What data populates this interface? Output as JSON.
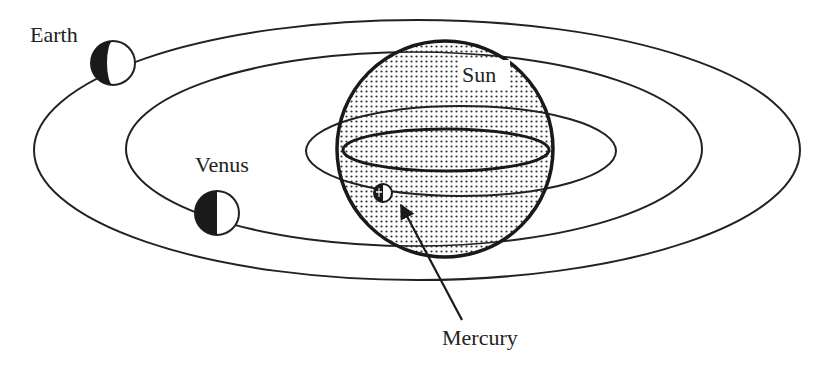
{
  "diagram": {
    "type": "solar-system-transit-schematic",
    "colors": {
      "line": "#222222",
      "background": "#ffffff",
      "sun_fill_dots": "#333333",
      "planet_dark": "#1a1a1a",
      "planet_light": "#ffffff"
    },
    "labels": {
      "earth": "Earth",
      "venus": "Venus",
      "sun": "Sun",
      "mercury": "Mercury"
    },
    "bodies": [
      {
        "name": "Sun",
        "cx": 445,
        "cy": 149,
        "r": 108,
        "fill": "stippled"
      },
      {
        "name": "Earth",
        "cx": 113,
        "cy": 63,
        "r": 22,
        "phase": "left-half-dark"
      },
      {
        "name": "Venus",
        "cx": 217,
        "cy": 213,
        "r": 22,
        "phase": "left-half-dark"
      },
      {
        "name": "Mercury",
        "cx": 383,
        "cy": 193,
        "r": 9,
        "phase": "left-half-dark"
      }
    ],
    "orbits": [
      {
        "name": "Earth orbit",
        "cx": 417,
        "cy": 150,
        "rx": 383,
        "ry": 130
      },
      {
        "name": "Venus orbit",
        "cx": 414,
        "cy": 149,
        "rx": 288,
        "ry": 97
      },
      {
        "name": "Mercury orbit",
        "cx": 461,
        "cy": 151,
        "rx": 155,
        "ry": 45
      }
    ],
    "sun_equator": {
      "cx": 446,
      "cy": 150,
      "rx": 103,
      "ry": 21
    },
    "arrow": {
      "from": [
        462,
        320
      ],
      "to": [
        400,
        203
      ],
      "points_to": "Mercury"
    }
  }
}
